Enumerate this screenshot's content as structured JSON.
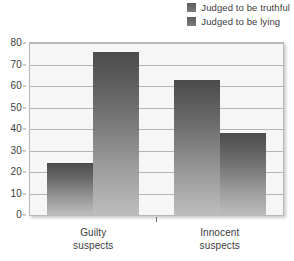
{
  "chart_data": {
    "type": "bar",
    "title": "",
    "subtitle": "",
    "xlabel": "",
    "ylabel": "",
    "categories": [
      "Guilty\nsuspects",
      "Innocent\nsuspects"
    ],
    "category_lines": [
      [
        "Guilty",
        "suspects"
      ],
      [
        "Innocent",
        "suspects"
      ]
    ],
    "series": [
      {
        "name": "Judged to be truthful",
        "values": [
          24,
          63
        ]
      },
      {
        "name": "Judged to be lying",
        "values": [
          76,
          38
        ]
      }
    ],
    "ylim": [
      0,
      80
    ],
    "yticks": [
      0,
      10,
      20,
      30,
      40,
      50,
      60,
      70,
      80
    ],
    "ytick_labels": [
      "0",
      "10",
      "20",
      "30",
      "40",
      "50",
      "60",
      "70",
      "80"
    ],
    "grid": true,
    "grid_axis": "y",
    "legend_position": "top-right",
    "colors": {
      "bar_top": "#4b4b4b",
      "bar_bottom": "#bdbdbd",
      "plot_background": "#f6f6f6",
      "gridline": "#b5b5b5",
      "frame_border": "#b9b9b9",
      "text": "#3c3c3c"
    }
  },
  "legend": {
    "items": [
      {
        "label": "Judged to be truthful"
      },
      {
        "label": "Judged to be lying"
      }
    ]
  }
}
